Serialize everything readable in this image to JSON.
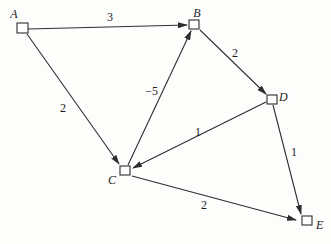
{
  "diagram": {
    "type": "directed-weighted-graph",
    "canvas": {
      "width": 331,
      "height": 244,
      "background": "#fdfdfc"
    },
    "style": {
      "line_color": "#2e2e2e",
      "node_fill": "#ffffff",
      "node_border": "#2e2e2e",
      "text_color": "#1c1c1c"
    },
    "nodes": [
      {
        "id": "A",
        "label": "A",
        "box": {
          "x": 17,
          "y": 23,
          "w": 11,
          "h": 10
        },
        "label_pos": {
          "x": 14,
          "y": 18,
          "anchor": "middle"
        }
      },
      {
        "id": "B",
        "label": "B",
        "box": {
          "x": 189,
          "y": 20,
          "w": 10,
          "h": 9
        },
        "label_pos": {
          "x": 197,
          "y": 17,
          "anchor": "middle"
        }
      },
      {
        "id": "C",
        "label": "C",
        "box": {
          "x": 120,
          "y": 166,
          "w": 10,
          "h": 9
        },
        "label_pos": {
          "x": 112,
          "y": 184,
          "anchor": "middle"
        }
      },
      {
        "id": "D",
        "label": "D",
        "box": {
          "x": 267,
          "y": 95,
          "w": 10,
          "h": 9
        },
        "label_pos": {
          "x": 279,
          "y": 101,
          "anchor": "start"
        }
      },
      {
        "id": "E",
        "label": "E",
        "box": {
          "x": 302,
          "y": 216,
          "w": 10,
          "h": 9
        },
        "label_pos": {
          "x": 316,
          "y": 229,
          "anchor": "start"
        }
      }
    ],
    "edges": [
      {
        "from": "A",
        "to": "B",
        "weight": "3",
        "line": {
          "x1": 28,
          "y1": 29,
          "x2": 187,
          "y2": 25
        },
        "label_pos": {
          "x": 110,
          "y": 21,
          "anchor": "middle"
        }
      },
      {
        "from": "A",
        "to": "C",
        "weight": "2",
        "line": {
          "x1": 27,
          "y1": 34,
          "x2": 119,
          "y2": 164
        },
        "label_pos": {
          "x": 63,
          "y": 112,
          "anchor": "middle"
        }
      },
      {
        "from": "C",
        "to": "B",
        "weight": "−5",
        "line": {
          "x1": 128,
          "y1": 165,
          "x2": 191,
          "y2": 31
        },
        "label_pos": {
          "x": 158,
          "y": 95,
          "anchor": "end"
        }
      },
      {
        "from": "B",
        "to": "D",
        "weight": "2",
        "line": {
          "x1": 200,
          "y1": 30,
          "x2": 266,
          "y2": 94
        },
        "label_pos": {
          "x": 232,
          "y": 57,
          "anchor": "start"
        }
      },
      {
        "from": "D",
        "to": "C",
        "weight": "1",
        "line": {
          "x1": 266,
          "y1": 102,
          "x2": 133,
          "y2": 168
        },
        "label_pos": {
          "x": 198,
          "y": 136,
          "anchor": "middle"
        }
      },
      {
        "from": "D",
        "to": "E",
        "weight": "1",
        "line": {
          "x1": 273,
          "y1": 105,
          "x2": 301,
          "y2": 214
        },
        "label_pos": {
          "x": 291,
          "y": 156,
          "anchor": "start"
        }
      },
      {
        "from": "C",
        "to": "E",
        "weight": "2",
        "line": {
          "x1": 132,
          "y1": 176,
          "x2": 296,
          "y2": 220
        },
        "label_pos": {
          "x": 204,
          "y": 209,
          "anchor": "middle"
        }
      }
    ]
  }
}
